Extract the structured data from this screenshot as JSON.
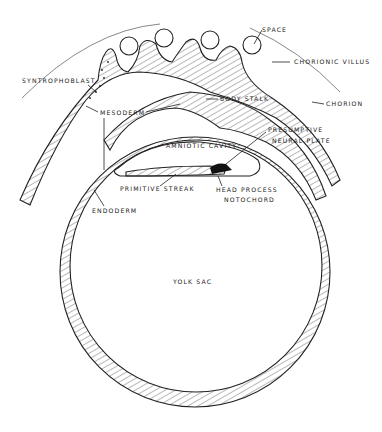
{
  "diagram": {
    "title": "",
    "labels": {
      "space": "SPACE",
      "chorionic_villus": "CHORIONIC VILLUS",
      "syntrophoblast": "SYNTROPHOBLAST",
      "body_stalk": "BODY STALK",
      "chorion": "CHORION",
      "mesoderm": "MESODERM",
      "amniotic_cavity": "AMNIOTIC CAVITY",
      "presumptive_1": "PRESUMPTIVE",
      "presumptive_2": "NEURAL PLATE",
      "primitive_streak": "PRIMITIVE STREAK",
      "head_process": "HEAD PROCESS",
      "notochord": "NOTOCHORD",
      "endoderm": "ENDODERM",
      "yolk_sac": "YOLK SAC"
    }
  }
}
